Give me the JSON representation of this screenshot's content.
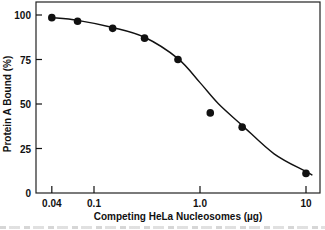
{
  "chart_data": {
    "type": "scatter",
    "title": "",
    "xlabel": "Competing HeLa Nucleosomes (µg)",
    "ylabel": "Protein A Bound (%)",
    "xscale": "log",
    "xlim": [
      0.032,
      13
    ],
    "ylim": [
      0,
      105
    ],
    "x_ticks": [
      0.04,
      0.1,
      1.0,
      10
    ],
    "x_tick_labels": [
      "0.04",
      "0.1",
      "1.0",
      "10"
    ],
    "y_ticks": [
      0,
      25,
      50,
      75,
      100
    ],
    "y_tick_labels": [
      "0",
      "25",
      "50",
      "75",
      "100"
    ],
    "grid": false,
    "legend": null,
    "series": [
      {
        "name": "measured",
        "marker": "filled-circle",
        "x": [
          0.04,
          0.07,
          0.15,
          0.3,
          0.62,
          1.25,
          2.5,
          10
        ],
        "y": [
          98.5,
          96.5,
          92.5,
          87,
          75,
          45,
          37,
          11
        ]
      },
      {
        "name": "fitted curve",
        "style": "solid-line",
        "x": [
          0.04,
          0.07,
          0.15,
          0.3,
          0.62,
          1.0,
          1.5,
          2.5,
          5,
          10,
          11.5
        ],
        "y": [
          98.5,
          97,
          93,
          87.5,
          75.5,
          62,
          50,
          38,
          22,
          12,
          10
        ]
      }
    ]
  },
  "caption": {
    "visible": "clipped, illegible"
  }
}
